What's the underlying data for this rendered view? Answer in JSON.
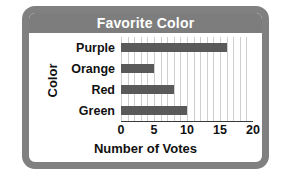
{
  "chart_data": {
    "type": "bar",
    "orientation": "horizontal",
    "title": "Favorite Color",
    "xlabel": "Number of Votes",
    "ylabel": "Color",
    "categories": [
      "Purple",
      "Orange",
      "Red",
      "Green"
    ],
    "values": [
      16,
      5,
      8,
      10
    ],
    "xlim": [
      0,
      20
    ],
    "xticks": [
      0,
      5,
      10,
      15,
      20
    ],
    "xtick_labels": [
      "0",
      "5",
      "10",
      "15",
      "20"
    ],
    "minor_gridline_step": 1,
    "grid": true,
    "legend": null,
    "bar_color": "#5a5a5a",
    "title_bar_color": "#7d7d7d",
    "title_text_color": "#ffffff",
    "frame_color": "#808080",
    "gridline_color": "#cfcfcf",
    "axis_color": "#3a3a3a",
    "background": "#ffffff"
  }
}
